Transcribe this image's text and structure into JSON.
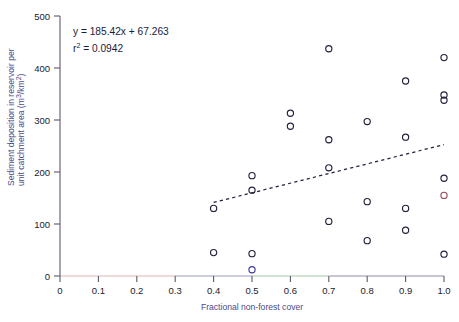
{
  "chart_data": {
    "type": "scatter",
    "title": "",
    "xlabel": "Fractional non-forest cover",
    "ylabel": "Sediment deposition in reservoir per unit catchment area (m3/km2)",
    "ylabel_line1": "Sediment deposition in reservoir per",
    "ylabel_line2_pre": "unit catchment area (m",
    "ylabel_line2_sup1": "3",
    "ylabel_line2_mid": "/km",
    "ylabel_line2_sup2": "2",
    "ylabel_line2_post": ")",
    "xlim": [
      0,
      1.0
    ],
    "ylim": [
      0,
      500
    ],
    "xticks": [
      0,
      0.1,
      0.2,
      0.3,
      0.4,
      0.5,
      0.6,
      0.7,
      0.8,
      0.9,
      1.0
    ],
    "xtick_labels": [
      "0",
      "0.1",
      "0.2",
      "0.3",
      "0.4",
      "0.5",
      "0.6",
      "0.7",
      "0.8",
      "0.9",
      "1.0"
    ],
    "yticks": [
      0,
      100,
      200,
      300,
      400,
      500
    ],
    "ytick_labels": [
      "0",
      "100",
      "200",
      "300",
      "400",
      "500"
    ],
    "grid": false,
    "legend": null,
    "annotations": {
      "equation": "y = 185.42x + 67.263",
      "r_squared_prefix": "r",
      "r_squared_sup": "2",
      "r_squared_value": " = 0.0942",
      "r_squared_full": "r2 = 0.0942"
    },
    "trendline": {
      "type": "linear",
      "slope": 185.42,
      "intercept": 67.263,
      "r_squared": 0.0942,
      "style": "dashed",
      "x_start": 0.4,
      "x_end": 1.0,
      "y_start": 141.4,
      "y_end": 252.7
    },
    "points": [
      {
        "x": 0.4,
        "y": 130
      },
      {
        "x": 0.4,
        "y": 45
      },
      {
        "x": 0.5,
        "y": 193
      },
      {
        "x": 0.5,
        "y": 165
      },
      {
        "x": 0.5,
        "y": 43
      },
      {
        "x": 0.5,
        "y": 12,
        "color": "blue"
      },
      {
        "x": 0.6,
        "y": 313
      },
      {
        "x": 0.6,
        "y": 288
      },
      {
        "x": 0.7,
        "y": 437
      },
      {
        "x": 0.7,
        "y": 262
      },
      {
        "x": 0.7,
        "y": 208
      },
      {
        "x": 0.7,
        "y": 105
      },
      {
        "x": 0.8,
        "y": 297
      },
      {
        "x": 0.8,
        "y": 143
      },
      {
        "x": 0.8,
        "y": 68
      },
      {
        "x": 0.9,
        "y": 375
      },
      {
        "x": 0.9,
        "y": 267
      },
      {
        "x": 0.9,
        "y": 130
      },
      {
        "x": 0.9,
        "y": 88
      },
      {
        "x": 1.0,
        "y": 420
      },
      {
        "x": 1.0,
        "y": 348
      },
      {
        "x": 1.0,
        "y": 338
      },
      {
        "x": 1.0,
        "y": 188
      },
      {
        "x": 1.0,
        "y": 155,
        "color": "red"
      },
      {
        "x": 1.0,
        "y": 42
      }
    ],
    "colors": {
      "marker": "#22223b",
      "marker_red": "#9b4a55",
      "marker_blue": "#3b3b9b",
      "axis_label": "#4a4a8c",
      "trendline": "#22223b",
      "background": "#ffffff"
    }
  }
}
